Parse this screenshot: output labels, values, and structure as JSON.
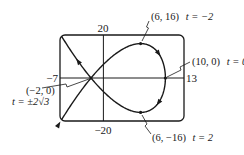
{
  "chart_data": {
    "type": "line",
    "title": "",
    "xlabel": "",
    "ylabel": "",
    "parametric": {
      "x_of_t": "10 - t^2",
      "y_of_t": "t^3 - 12t",
      "t_range": [
        -4.35,
        4.35
      ],
      "direction": "increasing t"
    },
    "xlim": [
      -7,
      13
    ],
    "ylim": [
      -20,
      20
    ],
    "grid": false,
    "legend": null,
    "window_labels": {
      "xmin": "−7",
      "xmax": "13",
      "ymax": "20",
      "ymin": "−20"
    },
    "annotated_points": [
      {
        "x": 6,
        "y": 16,
        "label": "(6, 16)",
        "t_label": "t = −2"
      },
      {
        "x": 10,
        "y": 0,
        "label": "(10, 0)",
        "t_label": "t = 0"
      },
      {
        "x": 6,
        "y": -16,
        "label": "(6, −16)",
        "t_label": "t = 2"
      },
      {
        "x": -2,
        "y": 0,
        "label": "(−2, 0)",
        "t_label": "t = ±2√3"
      }
    ],
    "series": [
      {
        "name": "parametric curve",
        "sample_points": [
          {
            "t": -4.35,
            "x": -8.92,
            "y": -30.1
          },
          {
            "t": -4,
            "x": -6,
            "y": -16
          },
          {
            "t": -3.4641,
            "x": -2,
            "y": 0
          },
          {
            "t": -3,
            "x": 1,
            "y": 9
          },
          {
            "t": -2,
            "x": 6,
            "y": 16
          },
          {
            "t": -1,
            "x": 9,
            "y": 11
          },
          {
            "t": 0,
            "x": 10,
            "y": 0
          },
          {
            "t": 1,
            "x": 9,
            "y": -11
          },
          {
            "t": 2,
            "x": 6,
            "y": -16
          },
          {
            "t": 3,
            "x": 1,
            "y": -9
          },
          {
            "t": 3.4641,
            "x": -2,
            "y": 0
          },
          {
            "t": 4,
            "x": -6,
            "y": 16
          },
          {
            "t": 4.35,
            "x": -8.92,
            "y": 30.1
          }
        ]
      }
    ]
  },
  "labels": {
    "ymax": "20",
    "ymin": "−20",
    "xmin": "−7",
    "xmax": "13",
    "p_top": "(6, 16)",
    "p_top_t": "t = −2",
    "p_right": "(10, 0)",
    "p_right_t": "t = 0",
    "p_bottom": "(6, −16)",
    "p_bottom_t": "t = 2",
    "p_cross": "(−2, 0)",
    "p_cross_t": "t = ±2√3"
  },
  "colors": {
    "ink": "#1a1a1a",
    "background": "#ffffff"
  }
}
